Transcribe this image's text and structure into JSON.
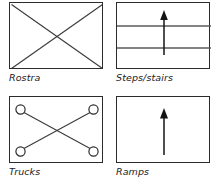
{
  "legend": {
    "colors": {
      "stroke": "#2b2b2b",
      "line_light": "#5a5a5a",
      "arrow": "#141414",
      "background": "#ffffff",
      "label_text": "#23201e"
    },
    "cells": [
      {
        "label": "Rostra",
        "symbol": "rectangle-with-diagonal-cross",
        "icon_name": "rostra-symbol-icon",
        "description": "Rectangle crossed by two full diagonals forming an X"
      },
      {
        "label": "Steps/stairs",
        "symbol": "rectangle-with-horizontal-lines-and-up-arrow",
        "icon_name": "steps-stairs-symbol-icon",
        "description": "Rectangle divided by two horizontal lines with a vertical up arrow through the centre",
        "horizontal_line_count": 2
      },
      {
        "label": "Trucks",
        "symbol": "rectangle-with-diagonal-cross-and-corner-circles",
        "icon_name": "trucks-symbol-icon",
        "description": "Rectangle crossed by two diagonals terminating in small open circles at each corner",
        "circle_count": 4
      },
      {
        "label": "Ramps",
        "symbol": "rectangle-with-up-arrow",
        "icon_name": "ramps-symbol-icon",
        "description": "Empty rectangle with a single vertical up arrow through the centre"
      }
    ]
  }
}
